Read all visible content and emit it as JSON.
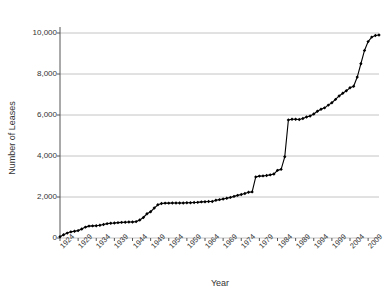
{
  "chart_data": {
    "type": "line",
    "title": "",
    "xlabel": "Year",
    "ylabel": "Number of Leases",
    "xlim": [
      1924,
      2012
    ],
    "ylim": [
      0,
      10000
    ],
    "grid": true,
    "legend": false,
    "marker": "filled-diamond",
    "line_color": "#000000",
    "grid_color": "#b5b5b5",
    "axis_color": "#555555",
    "y_ticks": [
      0,
      2000,
      4000,
      6000,
      8000,
      10000
    ],
    "y_tick_labels": [
      "0",
      "2,000",
      "4,000",
      "6,000",
      "8,000",
      "10,000"
    ],
    "x_ticks": [
      1924,
      1929,
      1934,
      1939,
      1944,
      1949,
      1954,
      1959,
      1964,
      1969,
      1974,
      1979,
      1984,
      1989,
      1994,
      1999,
      2004,
      2009
    ],
    "x_tick_labels": [
      "1924",
      "1929",
      "1934",
      "1939",
      "1944",
      "1949",
      "1954",
      "1959",
      "1964",
      "1969",
      "1974",
      "1979",
      "1984",
      "1989",
      "1994",
      "1999",
      "2004",
      "2009"
    ],
    "series": [
      {
        "name": "Cumulative leases",
        "x": [
          1924,
          1925,
          1926,
          1927,
          1928,
          1929,
          1930,
          1931,
          1932,
          1933,
          1934,
          1935,
          1936,
          1937,
          1938,
          1939,
          1940,
          1941,
          1942,
          1943,
          1944,
          1945,
          1946,
          1947,
          1948,
          1949,
          1950,
          1951,
          1952,
          1953,
          1954,
          1955,
          1956,
          1957,
          1958,
          1959,
          1960,
          1961,
          1962,
          1963,
          1964,
          1965,
          1966,
          1967,
          1968,
          1969,
          1970,
          1971,
          1972,
          1973,
          1974,
          1975,
          1976,
          1977,
          1978,
          1979,
          1980,
          1981,
          1982,
          1983,
          1984,
          1985,
          1986,
          1987,
          1988,
          1989,
          1990,
          1991,
          1992,
          1993,
          1994,
          1995,
          1996,
          1997,
          1998,
          1999,
          2000,
          2001,
          2002,
          2003,
          2004,
          2005,
          2006,
          2007,
          2008,
          2009,
          2010,
          2011,
          2012
        ],
        "values": [
          60,
          160,
          240,
          300,
          330,
          360,
          440,
          530,
          580,
          590,
          600,
          620,
          660,
          700,
          720,
          730,
          750,
          760,
          770,
          780,
          780,
          800,
          880,
          1000,
          1180,
          1280,
          1460,
          1620,
          1680,
          1700,
          1700,
          1710,
          1710,
          1710,
          1710,
          1720,
          1720,
          1730,
          1740,
          1760,
          1770,
          1780,
          1780,
          1840,
          1870,
          1900,
          1940,
          1980,
          2030,
          2080,
          2120,
          2170,
          2230,
          2250,
          2980,
          3020,
          3030,
          3050,
          3080,
          3120,
          3300,
          3350,
          3960,
          5760,
          5790,
          5790,
          5780,
          5830,
          5900,
          5950,
          6050,
          6180,
          6280,
          6350,
          6480,
          6600,
          6760,
          6930,
          7060,
          7180,
          7330,
          7400,
          7850,
          8500,
          9150,
          9580,
          9800,
          9880,
          9900
        ]
      }
    ]
  },
  "axes": {
    "y_title": "Number of Leases",
    "x_title": "Year"
  }
}
